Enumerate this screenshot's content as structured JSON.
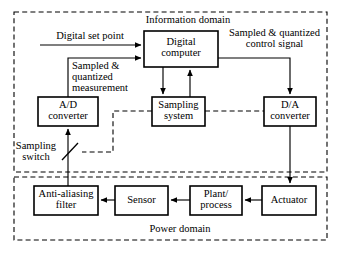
{
  "diagram": {
    "type": "block-diagram",
    "canvas": {
      "width": 339,
      "height": 253
    },
    "colors": {
      "stroke": "#000000",
      "background": "#ffffff",
      "box_fill": "#ffffff"
    },
    "domains": [
      {
        "id": "information-domain",
        "label": "Information domain",
        "style": "dashed",
        "bounds": {
          "x": 14,
          "y": 12,
          "width": 313,
          "height": 160
        }
      },
      {
        "id": "power-domain",
        "label": "Power domain",
        "style": "dashed",
        "bounds": {
          "x": 14,
          "y": 177,
          "width": 313,
          "height": 63
        }
      }
    ],
    "blocks": [
      {
        "id": "digital-computer",
        "label": "Digital\ncomputer",
        "x": 144,
        "y": 31,
        "width": 74,
        "height": 36
      },
      {
        "id": "ad-converter",
        "label": "A/D\nconverter",
        "x": 38,
        "y": 97,
        "width": 60,
        "height": 29
      },
      {
        "id": "sampling-system",
        "label": "Sampling\nsystem",
        "x": 152,
        "y": 97,
        "width": 53,
        "height": 29
      },
      {
        "id": "da-converter",
        "label": "D/A\nconverter",
        "x": 264,
        "y": 97,
        "width": 52,
        "height": 29
      },
      {
        "id": "anti-aliasing-filter",
        "label": "Anti-aliasing\nfilter",
        "x": 34,
        "y": 186,
        "width": 64,
        "height": 29
      },
      {
        "id": "sensor",
        "label": "Sensor",
        "x": 115,
        "y": 186,
        "width": 53,
        "height": 29
      },
      {
        "id": "plant-process",
        "label": "Plant/\nprocess",
        "x": 190,
        "y": 186,
        "width": 52,
        "height": 29
      },
      {
        "id": "actuator",
        "label": "Actuator",
        "x": 262,
        "y": 186,
        "width": 54,
        "height": 29
      }
    ],
    "signal_labels": [
      {
        "id": "digital-set-point",
        "label": "Digital set point",
        "x": 42,
        "y": 32
      },
      {
        "id": "sampled-quantized-control-signal",
        "label": "Sampled & quantized\ncontrol signal",
        "x": 222,
        "y": 29
      },
      {
        "id": "sampled-quantized-measurement",
        "label": "Sampled &\nquantized\nmeasurement",
        "x": 71,
        "y": 60
      },
      {
        "id": "sampling-switch",
        "label": "Sampling\nswitch",
        "x": 14,
        "y": 141
      }
    ],
    "connections": [
      {
        "id": "setpoint-to-computer",
        "from": "digital set point input",
        "to": "digital-computer",
        "kind": "arrow"
      },
      {
        "id": "measurement-to-computer",
        "from": "ad-converter",
        "to": "digital-computer",
        "kind": "arrow"
      },
      {
        "id": "computer-to-sampling-system",
        "from": "digital-computer",
        "to": "sampling-system",
        "kind": "arrow"
      },
      {
        "id": "sampling-system-to-computer",
        "from": "sampling-system",
        "to": "digital-computer",
        "kind": "arrow"
      },
      {
        "id": "computer-to-da-converter",
        "from": "digital-computer",
        "to": "da-converter",
        "kind": "arrow"
      },
      {
        "id": "da-converter-to-actuator",
        "from": "da-converter",
        "to": "actuator",
        "kind": "arrow"
      },
      {
        "id": "actuator-to-plant",
        "from": "actuator",
        "to": "plant-process",
        "kind": "arrow"
      },
      {
        "id": "plant-to-sensor",
        "from": "plant-process",
        "to": "sensor",
        "kind": "arrow"
      },
      {
        "id": "sensor-to-filter",
        "from": "sensor",
        "to": "anti-aliasing-filter",
        "kind": "arrow"
      },
      {
        "id": "filter-to-ad-converter",
        "from": "anti-aliasing-filter",
        "to": "ad-converter",
        "kind": "arrow-through-switch"
      },
      {
        "id": "sampling-system-to-switch",
        "from": "sampling-system",
        "to": "sampling-switch",
        "kind": "dashed"
      },
      {
        "id": "sampling-system-to-da-converter",
        "from": "sampling-system",
        "to": "da-converter",
        "kind": "dashed"
      }
    ]
  }
}
